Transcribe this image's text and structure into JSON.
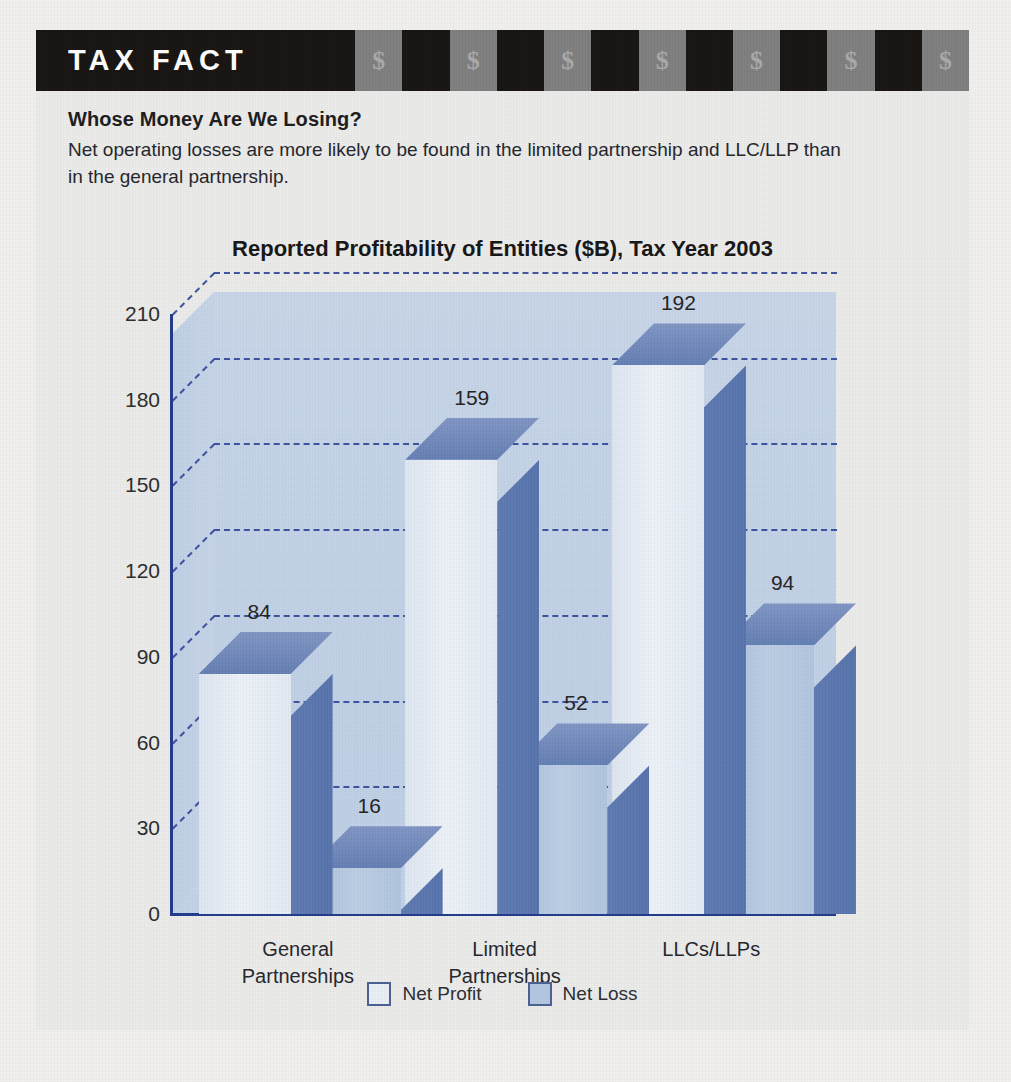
{
  "banner": {
    "title": "TAX FACT",
    "stripe_pattern": [
      "dark",
      "gray",
      "dark",
      "gray",
      "dark",
      "gray",
      "dark",
      "gray",
      "dark",
      "gray",
      "dark",
      "gray",
      "dark",
      "gray"
    ],
    "dollar_glyph": "$",
    "dark_color": "#151210",
    "gray_color": "#7e7e7e"
  },
  "article": {
    "heading": "Whose Money Are We Losing?",
    "body": "Net operating losses are more likely to be found in the limited partnership and LLC/LLP than in the general partnership."
  },
  "chart_data": {
    "type": "bar",
    "title": "Reported Profitability of Entities ($B), Tax Year 2003",
    "xlabel": "",
    "ylabel": "",
    "categories": [
      "General Partnerships",
      "Limited Partnerships",
      "LLCs/LLPs"
    ],
    "category_lines": [
      [
        "General",
        "Partnerships"
      ],
      [
        "Limited",
        "Partnerships"
      ],
      [
        "LLCs/LLPs"
      ]
    ],
    "series": [
      {
        "name": "Net Profit",
        "values": [
          84,
          159,
          192
        ],
        "color": "#eaf0f7"
      },
      {
        "name": "Net Loss",
        "values": [
          16,
          52,
          94
        ],
        "color": "#b4c7e1"
      }
    ],
    "yticks": [
      0,
      30,
      60,
      90,
      120,
      150,
      180,
      210
    ],
    "ylim": [
      0,
      210
    ],
    "grid": true,
    "grid_color": "#31479a",
    "legend_position": "bottom",
    "plot_background": "#c3d3e8",
    "axis_color": "#21398c",
    "three_d": true
  },
  "legend": {
    "items": [
      {
        "label": "Net Profit"
      },
      {
        "label": "Net Loss"
      }
    ]
  }
}
